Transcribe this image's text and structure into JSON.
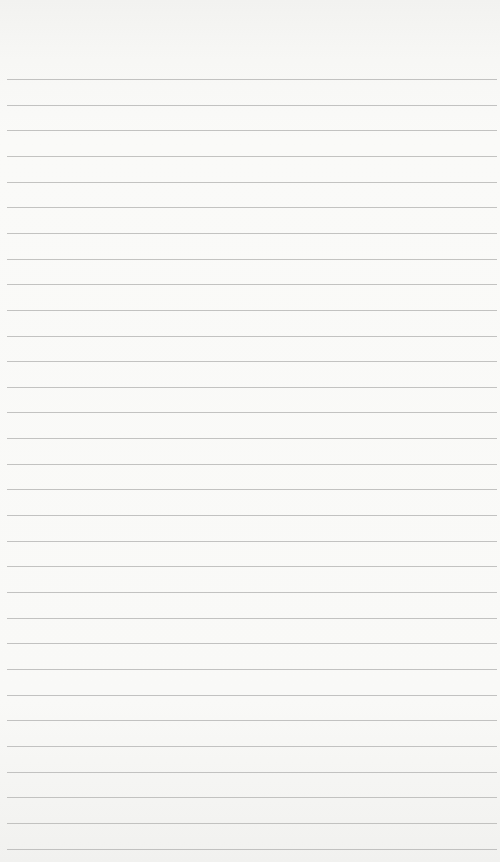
{
  "page": {
    "type": "lined-paper",
    "background_color": "#fafaf8",
    "rule_color": "#b9b9b7",
    "rule_count": 31,
    "first_rule_y": 79,
    "rule_spacing": 25.65
  }
}
